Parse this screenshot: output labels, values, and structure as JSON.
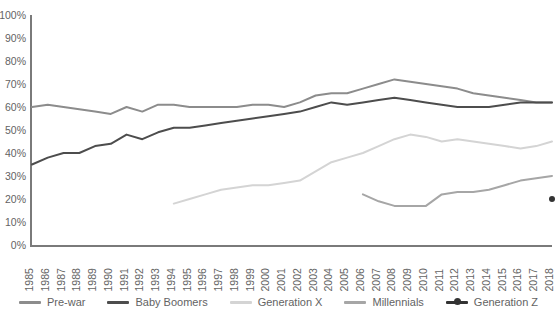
{
  "chart_data": {
    "type": "line",
    "title": "",
    "xlabel": "",
    "ylabel": "",
    "grid": false,
    "legend_position": "bottom",
    "ylim": [
      0,
      100
    ],
    "ytick_labels": [
      "100%",
      "90%",
      "80%",
      "70%",
      "60%",
      "50%",
      "40%",
      "30%",
      "20%",
      "10%",
      "0%"
    ],
    "ytick_values": [
      100,
      90,
      80,
      70,
      60,
      50,
      40,
      30,
      20,
      10,
      0
    ],
    "categories": [
      "1985",
      "1986",
      "1987",
      "1988",
      "1989",
      "1990",
      "1991",
      "1992",
      "1993",
      "1994",
      "1995",
      "1996",
      "1997",
      "1998",
      "1999",
      "2000",
      "2001",
      "2002",
      "2003",
      "2004",
      "2005",
      "2006",
      "2007",
      "2008",
      "2009",
      "2010",
      "2011",
      "2012",
      "2013",
      "2014",
      "2015",
      "2016",
      "2017",
      "2018"
    ],
    "series": [
      {
        "name": "Pre-war",
        "color": "#8c8c8c",
        "marker": "none",
        "start_year": "1985",
        "values": [
          60,
          61,
          60,
          59,
          58,
          57,
          60,
          58,
          61,
          61,
          60,
          60,
          60,
          60,
          61,
          61,
          60,
          62,
          65,
          66,
          66,
          68,
          70,
          72,
          71,
          70,
          69,
          68,
          66,
          65,
          64,
          63,
          62,
          62
        ]
      },
      {
        "name": "Baby Boomers",
        "color": "#4d4d4d",
        "marker": "none",
        "start_year": "1985",
        "values": [
          35,
          38,
          40,
          40,
          43,
          44,
          48,
          46,
          49,
          51,
          51,
          52,
          53,
          54,
          55,
          56,
          57,
          58,
          60,
          62,
          61,
          62,
          63,
          64,
          63,
          62,
          61,
          60,
          60,
          60,
          61,
          62,
          62,
          62
        ]
      },
      {
        "name": "Generation X",
        "color": "#d4d4d4",
        "marker": "none",
        "start_year": "1994",
        "values": [
          null,
          null,
          null,
          null,
          null,
          null,
          null,
          null,
          null,
          18,
          20,
          22,
          24,
          25,
          26,
          26,
          27,
          28,
          32,
          36,
          38,
          40,
          43,
          46,
          48,
          47,
          45,
          46,
          45,
          44,
          43,
          42,
          43,
          45
        ]
      },
      {
        "name": "Millennials",
        "color": "#a6a6a6",
        "marker": "none",
        "start_year": "2006",
        "values": [
          null,
          null,
          null,
          null,
          null,
          null,
          null,
          null,
          null,
          null,
          null,
          null,
          null,
          null,
          null,
          null,
          null,
          null,
          null,
          null,
          null,
          22,
          19,
          17,
          17,
          17,
          22,
          23,
          23,
          24,
          26,
          28,
          29,
          30
        ]
      },
      {
        "name": "Generation Z",
        "color": "#333333",
        "marker": "circle",
        "start_year": "2018",
        "values": [
          null,
          null,
          null,
          null,
          null,
          null,
          null,
          null,
          null,
          null,
          null,
          null,
          null,
          null,
          null,
          null,
          null,
          null,
          null,
          null,
          null,
          null,
          null,
          null,
          null,
          null,
          null,
          null,
          null,
          null,
          null,
          null,
          null,
          20
        ]
      }
    ]
  }
}
